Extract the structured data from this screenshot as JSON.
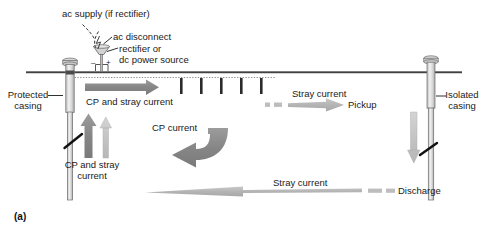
{
  "figure": {
    "panel_label": "(a)",
    "caption_labels": {
      "ac_supply": "ac supply (if rectifier)",
      "ac_disconnect": "ac disconnect",
      "rectifier_line1": "rectifier or",
      "rectifier_line2": "dc power source",
      "protected_casing_line1": "Protected",
      "protected_casing_line2": "casing",
      "isolated_casing_line1": "Isolated",
      "isolated_casing_line2": "casing",
      "cp_and_stray_current_top": "CP and stray current",
      "cp_and_stray_current_left_line1": "CP and stray",
      "cp_and_stray_current_left_line2": "current",
      "cp_current": "CP current",
      "stray_current_upper": "Stray current",
      "stray_current_lower": "Stray current",
      "pickup": "Pickup",
      "discharge": "Discharge",
      "terminal_negative": "–",
      "terminal_positive": "+"
    },
    "colors": {
      "ground_line": "#3a3a3a",
      "casing_outline": "#6e6e6e",
      "casing_fill": "#dcdcdc",
      "arrow_dark": "#8a8a8a",
      "arrow_light": "#c3c3c3",
      "arrow_mid": "#9b9b9b",
      "dotted_line": "#8c8c8c",
      "tick_mark": "#2b2b2b",
      "text": "#1a1a1a",
      "background": "#ffffff"
    },
    "elements": {
      "anode_tick_count": 5,
      "up_arrow_count": 2,
      "down_arrow_count": 1
    }
  }
}
